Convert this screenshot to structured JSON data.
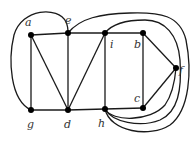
{
  "diagram": {
    "type": "graph",
    "vertices": [
      {
        "id": "a",
        "label": "a",
        "x": 31,
        "y": 35,
        "lx": 25,
        "ly": 23
      },
      {
        "id": "e",
        "label": "e",
        "x": 68,
        "y": 33,
        "lx": 66,
        "ly": 22
      },
      {
        "id": "i",
        "label": "i",
        "x": 105,
        "y": 33,
        "lx": 110,
        "ly": 47
      },
      {
        "id": "b",
        "label": "b",
        "x": 143,
        "y": 33,
        "lx": 135,
        "ly": 47
      },
      {
        "id": "f",
        "label": "f",
        "x": 176,
        "y": 68,
        "lx": 180,
        "ly": 73
      },
      {
        "id": "c",
        "label": "c",
        "x": 143,
        "y": 108,
        "lx": 135,
        "ly": 101
      },
      {
        "id": "h",
        "label": "h",
        "x": 105,
        "y": 109,
        "lx": 98,
        "ly": 126
      },
      {
        "id": "d",
        "label": "d",
        "x": 68,
        "y": 110,
        "lx": 64,
        "ly": 127
      },
      {
        "id": "g",
        "label": "g",
        "x": 31,
        "y": 110,
        "lx": 27,
        "ly": 127
      }
    ],
    "edges": [
      [
        "a",
        "e"
      ],
      [
        "e",
        "i"
      ],
      [
        "i",
        "b"
      ],
      [
        "b",
        "f"
      ],
      [
        "f",
        "c"
      ],
      [
        "c",
        "h"
      ],
      [
        "h",
        "d"
      ],
      [
        "d",
        "g"
      ],
      [
        "a",
        "g"
      ],
      [
        "a",
        "d"
      ],
      [
        "e",
        "d"
      ],
      [
        "i",
        "d"
      ],
      [
        "i",
        "h"
      ],
      [
        "b",
        "c"
      ],
      [
        "g",
        "e"
      ],
      [
        "e",
        "h"
      ],
      [
        "i",
        "h"
      ],
      [
        "h",
        "f"
      ]
    ]
  }
}
